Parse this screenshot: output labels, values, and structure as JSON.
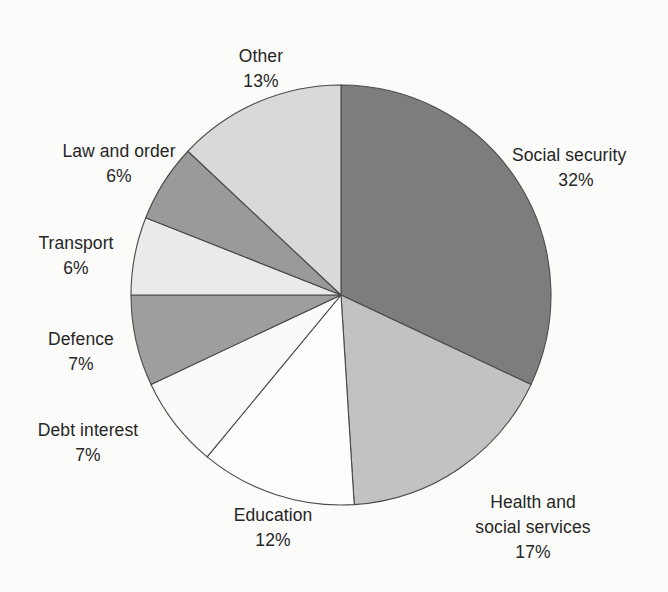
{
  "chart_data": {
    "type": "pie",
    "title": "",
    "subtitle": "",
    "xlabel": "",
    "ylabel": "",
    "grid": false,
    "legend": "none",
    "label_format": "name over percentage",
    "start_angle_deg": 0,
    "direction": "clockwise",
    "units": "percent",
    "total": 100,
    "categories": [
      "Social security",
      "Health and social services",
      "Education",
      "Debt interest",
      "Defence",
      "Transport",
      "Law and order",
      "Other"
    ],
    "values": [
      32,
      17,
      12,
      7,
      7,
      6,
      6,
      13
    ],
    "slices": [
      {
        "name": "Social security",
        "name_lines": [
          "Social security"
        ],
        "value": 32,
        "value_label": "32%",
        "color": "#7d7d7d"
      },
      {
        "name": "Health and social services",
        "name_lines": [
          "Health and",
          "social services"
        ],
        "value": 17,
        "value_label": "17%",
        "color": "#c2c2c2"
      },
      {
        "name": "Education",
        "name_lines": [
          "Education"
        ],
        "value": 12,
        "value_label": "12%",
        "color": "#fdfdfd"
      },
      {
        "name": "Debt interest",
        "name_lines": [
          "Debt interest"
        ],
        "value": 7,
        "value_label": "7%",
        "color": "#fafafa"
      },
      {
        "name": "Defence",
        "name_lines": [
          "Defence"
        ],
        "value": 7,
        "value_label": "7%",
        "color": "#9e9e9e"
      },
      {
        "name": "Transport",
        "name_lines": [
          "Transport"
        ],
        "value": 6,
        "value_label": "6%",
        "color": "#eaeaea"
      },
      {
        "name": "Law and order",
        "name_lines": [
          "Law and order"
        ],
        "value": 6,
        "value_label": "6%",
        "color": "#9a9a9a"
      },
      {
        "name": "Other",
        "name_lines": [
          "Other"
        ],
        "value": 13,
        "value_label": "13%",
        "color": "#d9d9d9"
      }
    ]
  },
  "labels": {
    "social_security": {
      "name": "Social security",
      "value": "32%"
    },
    "health": {
      "line1": "Health and",
      "line2": "social services",
      "value": "17%"
    },
    "education": {
      "name": "Education",
      "value": "12%"
    },
    "debt_interest": {
      "name": "Debt interest",
      "value": "7%"
    },
    "defence": {
      "name": "Defence",
      "value": "7%"
    },
    "transport": {
      "name": "Transport",
      "value": "6%"
    },
    "law_and_order": {
      "name": "Law and order",
      "value": "6%"
    },
    "other": {
      "name": "Other",
      "value": "13%"
    }
  },
  "style": {
    "background": "#fbfbfa",
    "outline": "#4a4a4a",
    "text": "#262626"
  },
  "geometry": {
    "center_x": 341,
    "center_y": 295,
    "radius": 210
  }
}
